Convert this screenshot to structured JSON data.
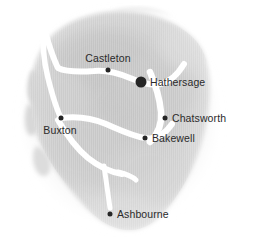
{
  "map": {
    "title": "Peak District locator map",
    "region_name": "Peak District",
    "background_color": "#ffffff",
    "landmass_color": "#cfcfcf",
    "road_color": "#ffffff",
    "marker_color": "#252525",
    "label_color": "#2a2a2a",
    "width": 253,
    "height": 242
  },
  "places": [
    {
      "name": "Castleton",
      "dot_x": 108,
      "dot_y": 70,
      "dot_size": 5,
      "label_x": 108,
      "label_y": 64,
      "label_position": "above-center",
      "highlighted": false
    },
    {
      "name": "Hathersage",
      "dot_x": 141,
      "dot_y": 82,
      "dot_size": 11,
      "label_x": 150,
      "label_y": 82,
      "label_position": "right",
      "highlighted": true
    },
    {
      "name": "Chatsworth",
      "dot_x": 165,
      "dot_y": 118,
      "dot_size": 5,
      "label_x": 172,
      "label_y": 118,
      "label_position": "right",
      "highlighted": false
    },
    {
      "name": "Bakewell",
      "dot_x": 145,
      "dot_y": 138,
      "dot_size": 5,
      "label_x": 152,
      "label_y": 138,
      "label_position": "right",
      "highlighted": false
    },
    {
      "name": "Buxton",
      "dot_x": 61,
      "dot_y": 118,
      "dot_size": 5,
      "label_x": 60,
      "label_y": 124,
      "label_position": "below-left",
      "highlighted": false
    },
    {
      "name": "Ashbourne",
      "dot_x": 110,
      "dot_y": 214,
      "dot_size": 5,
      "label_x": 117,
      "label_y": 214,
      "label_position": "right",
      "highlighted": false
    }
  ]
}
